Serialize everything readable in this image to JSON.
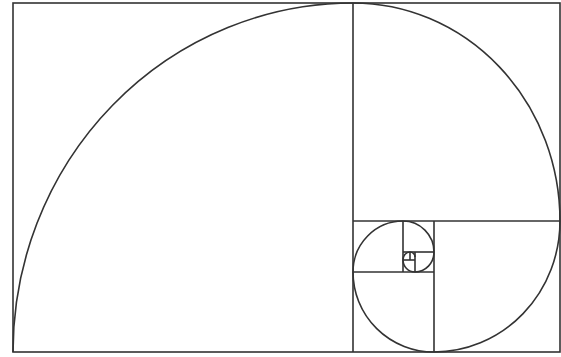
{
  "diagram": {
    "type": "golden-spiral",
    "stroke_color": "#333333",
    "background": "#ffffff",
    "frame": {
      "x1": 13,
      "y1": 3,
      "x2": 560,
      "y2": 352
    },
    "divisions": [
      {
        "x1": 353,
        "y1": 3,
        "x2": 353,
        "y2": 352
      },
      {
        "x1": 353,
        "y1": 221,
        "x2": 560,
        "y2": 221
      },
      {
        "x1": 434,
        "y1": 221,
        "x2": 434,
        "y2": 352
      },
      {
        "x1": 353,
        "y1": 272,
        "x2": 434,
        "y2": 272
      },
      {
        "x1": 403,
        "y1": 221,
        "x2": 403,
        "y2": 272
      },
      {
        "x1": 403,
        "y1": 252,
        "x2": 434,
        "y2": 252
      },
      {
        "x1": 415,
        "y1": 252,
        "x2": 415,
        "y2": 272
      },
      {
        "x1": 403,
        "y1": 260,
        "x2": 415,
        "y2": 260
      },
      {
        "x1": 410,
        "y1": 252,
        "x2": 410,
        "y2": 260
      }
    ]
  }
}
